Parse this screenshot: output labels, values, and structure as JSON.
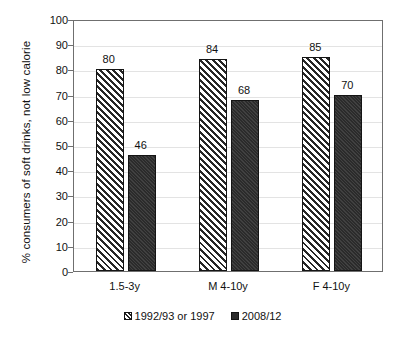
{
  "chart_data": {
    "type": "bar",
    "title": "",
    "xlabel": "",
    "ylabel": "% consumers of  soft drinks, not low calorie",
    "categories": [
      "1.5-3y",
      "M 4-10y",
      "F 4-10y"
    ],
    "series": [
      {
        "name": "1992/93 or 1997",
        "values": [
          80,
          84,
          85
        ],
        "fill": "diagonal-hatch",
        "color": "#262626"
      },
      {
        "name": "2008/12",
        "values": [
          46,
          68,
          70
        ],
        "fill": "solid",
        "color": "#2b2b2b"
      }
    ],
    "ylim": [
      0,
      100
    ],
    "ytick_step": 10,
    "yticks": [
      "0",
      "10",
      "20",
      "30",
      "40",
      "50",
      "60",
      "70",
      "80",
      "90",
      "100"
    ],
    "grid": "horizontal",
    "legend_position": "bottom",
    "data_labels": true
  },
  "legend": {
    "entries": [
      {
        "label": "1992/93 or 1997"
      },
      {
        "label": "2008/12"
      }
    ]
  }
}
